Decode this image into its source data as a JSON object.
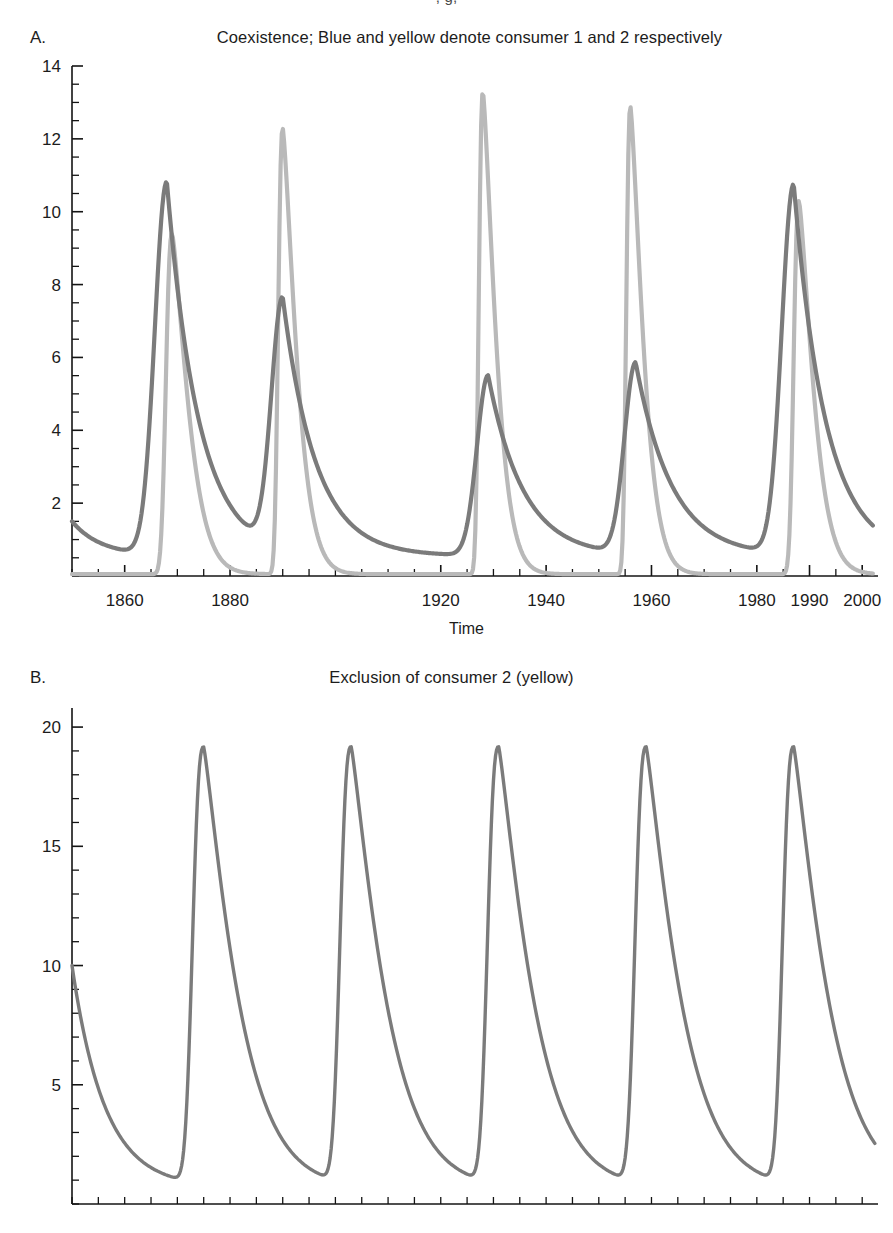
{
  "figure": {
    "top_cropped_text": ", g,",
    "background_color": "#ffffff"
  },
  "panels": [
    {
      "id": "A",
      "letter": "A.",
      "title": "Coexistence; Blue and yellow denote consumer 1 and 2 respectively",
      "xlabel": "Time"
    },
    {
      "id": "B",
      "letter": "B.",
      "title": "Exclusion of consumer 2 (yellow)",
      "xlabel": ""
    }
  ],
  "colors": {
    "consumer1_blue": "#7b7b7b",
    "consumer2_yellow": "#b9b9b9",
    "axis": "#141414",
    "text": "#1c1c1c"
  },
  "chart_data": [
    {
      "type": "line",
      "panel": "A",
      "title": "Coexistence; Blue and yellow denote consumer 1 and 2 respectively",
      "xlabel": "Time",
      "ylabel": "",
      "xlim": [
        1850,
        2003
      ],
      "ylim": [
        0,
        14
      ],
      "grid": false,
      "legend": "none",
      "xticks": [
        1860,
        1880,
        1990,
        1920,
        1940,
        1960,
        1980,
        2000
      ],
      "xtick_labels": [
        "1860",
        "1880",
        "1990",
        "1920",
        "1940",
        "1960",
        "1980",
        "2000"
      ],
      "xtick_minor_step": 5,
      "yticks": [
        2,
        4,
        6,
        8,
        10,
        12,
        14
      ],
      "ytick_labels": [
        "2",
        "4",
        "6",
        "8",
        "10",
        "12",
        "14"
      ],
      "ytick_minor_step": 0.5,
      "annotations": [
        "Blue curve (consumer 1) peaks: 10.8, 7.4, 5.5, 5.8, 10.7",
        "Yellow curve (consumer 2) peaks: 9.4, 12.3, 13.3, 12.9, 10.3",
        "Cycle period approximately 33 years"
      ],
      "series": [
        {
          "name": "consumer 1 (blue)",
          "color": "#7b7b7b",
          "peak_years": [
            1868,
            1890,
            1929,
            1957,
            1987
          ],
          "peak_values": [
            10.8,
            7.4,
            5.5,
            5.8,
            10.7
          ],
          "trough_value": 0.55,
          "start_value": 1.5,
          "end_value": 1.8
        },
        {
          "name": "consumer 2 (yellow)",
          "color": "#b9b9b9",
          "peak_years": [
            1869,
            1890,
            1928,
            1956,
            1988
          ],
          "peak_values": [
            9.4,
            12.3,
            13.3,
            12.9,
            10.3
          ],
          "trough_value": 0.05,
          "start_value": 0.05,
          "end_value": 0.05
        }
      ]
    },
    {
      "type": "line",
      "panel": "B",
      "title": "Exclusion of consumer 2 (yellow)",
      "xlabel": "",
      "ylabel": "",
      "xlim": [
        0,
        153
      ],
      "ylim": [
        0,
        20.8
      ],
      "grid": false,
      "legend": "none",
      "xticks": [],
      "xtick_labels": [],
      "xtick_minor_step": 5,
      "yticks": [
        5,
        10,
        15,
        20
      ],
      "ytick_labels": [
        "5",
        "10",
        "15",
        "20"
      ],
      "ytick_minor_step": 1,
      "annotations": [
        "Only consumer 1 (blue) persists; consumer 2 (yellow) is excluded",
        "Five limit-cycle peaks all reaching 19.0",
        "Cycle period approximately 28 units"
      ],
      "series": [
        {
          "name": "consumer 1 (blue)",
          "color": "#7b7b7b",
          "peak_x": [
            25,
            53,
            81,
            109,
            137
          ],
          "peak_values": [
            19.0,
            19.0,
            19.0,
            19.0,
            19.0
          ],
          "trough_value": 0.7,
          "start_value": 10.0,
          "end_value": 9.7
        },
        {
          "name": "consumer 2 (yellow)",
          "color": "#b9b9b9",
          "peak_x": [],
          "peak_values": [],
          "trough_value": 0,
          "start_value": 0,
          "end_value": 0
        }
      ]
    }
  ]
}
